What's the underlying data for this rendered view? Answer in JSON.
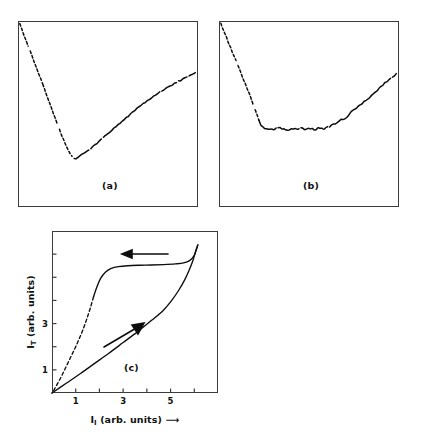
{
  "figure": {
    "panels": [
      {
        "id": "a",
        "caption": "(a)"
      },
      {
        "id": "b",
        "caption": "(b)"
      },
      {
        "id": "c",
        "caption": "(c)"
      }
    ]
  },
  "axes": {
    "x_title_symbol": "I",
    "x_title_subscript": "I",
    "x_title_units": "(arb. units)",
    "x_title_arrow": "⟶",
    "y_title_symbol": "I",
    "y_title_subscript": "T",
    "y_title_units": "(arb. units)",
    "x_ticks": [
      {
        "value": 1,
        "label": "1"
      },
      {
        "value": 2,
        "label": ""
      },
      {
        "value": 3,
        "label": "3"
      },
      {
        "value": 4,
        "label": ""
      },
      {
        "value": 5,
        "label": "5"
      },
      {
        "value": 6,
        "label": ""
      }
    ],
    "y_ticks": [
      {
        "value": 1,
        "label": "1"
      },
      {
        "value": 2,
        "label": ""
      },
      {
        "value": 3,
        "label": "3"
      },
      {
        "value": 4,
        "label": ""
      },
      {
        "value": 5,
        "label": ""
      },
      {
        "value": 6,
        "label": ""
      }
    ]
  },
  "annotations": {
    "upper_arrow_direction": "left",
    "lower_arrow_direction": "up-right"
  },
  "colors": {
    "curve": "#0d0d0d",
    "frame": "#3c3c3c",
    "background": "#ffffff"
  },
  "chart_data": [
    {
      "type": "line",
      "panel": "a",
      "title": "(a)",
      "xlabel": "",
      "ylabel": "",
      "xlim": [
        0,
        1
      ],
      "ylim": [
        0,
        1
      ],
      "grid": false,
      "legend": "none",
      "notes": "Normalised panel coordinates: x 0 = left frame, 1 = right frame; y 0 = bottom frame, 1 = top frame. Trace enters at top-left, falls steeply (dashed/noisy) to a minimum near x=0.31, then rises monotonically with small noise to the right edge.",
      "series": [
        {
          "name": "transmitted-intensity-trace-a",
          "style": "noisy-broken",
          "x": [
            0.01,
            0.03,
            0.055,
            0.08,
            0.105,
            0.13,
            0.155,
            0.18,
            0.205,
            0.23,
            0.255,
            0.28,
            0.3,
            0.315,
            0.33,
            0.35,
            0.37,
            0.395,
            0.42,
            0.45,
            0.48,
            0.51,
            0.54,
            0.57,
            0.6,
            0.63,
            0.66,
            0.69,
            0.72,
            0.75,
            0.78,
            0.81,
            0.84,
            0.87,
            0.9,
            0.93,
            0.96,
            0.985
          ],
          "y": [
            0.985,
            0.93,
            0.868,
            0.806,
            0.742,
            0.678,
            0.614,
            0.548,
            0.482,
            0.418,
            0.356,
            0.302,
            0.272,
            0.258,
            0.266,
            0.278,
            0.292,
            0.308,
            0.328,
            0.352,
            0.378,
            0.402,
            0.428,
            0.452,
            0.478,
            0.505,
            0.528,
            0.552,
            0.572,
            0.592,
            0.612,
            0.63,
            0.648,
            0.664,
            0.68,
            0.694,
            0.708,
            0.722
          ]
        }
      ]
    },
    {
      "type": "line",
      "panel": "b",
      "title": "(b)",
      "xlabel": "",
      "ylabel": "",
      "xlim": [
        0,
        1
      ],
      "ylim": [
        0,
        1
      ],
      "grid": false,
      "legend": "none",
      "notes": "Normalised panel coordinates. Trace enters at top-left, drops steeply (dashed) to a long flat noisy plateau from x=0.22 to x=0.60, then rises to the right edge.",
      "series": [
        {
          "name": "transmitted-intensity-trace-b",
          "style": "noisy-broken",
          "x": [
            0.01,
            0.035,
            0.06,
            0.085,
            0.11,
            0.135,
            0.16,
            0.185,
            0.21,
            0.23,
            0.255,
            0.28,
            0.305,
            0.33,
            0.355,
            0.38,
            0.405,
            0.43,
            0.455,
            0.48,
            0.505,
            0.53,
            0.555,
            0.58,
            0.605,
            0.63,
            0.655,
            0.68,
            0.705,
            0.73,
            0.76,
            0.79,
            0.82,
            0.85,
            0.88,
            0.91,
            0.945,
            0.985
          ],
          "y": [
            0.985,
            0.925,
            0.866,
            0.808,
            0.748,
            0.688,
            0.628,
            0.566,
            0.5,
            0.446,
            0.418,
            0.422,
            0.414,
            0.428,
            0.42,
            0.414,
            0.424,
            0.418,
            0.426,
            0.418,
            0.424,
            0.416,
            0.424,
            0.418,
            0.43,
            0.44,
            0.452,
            0.47,
            0.478,
            0.508,
            0.528,
            0.552,
            0.578,
            0.602,
            0.63,
            0.656,
            0.686,
            0.714
          ]
        }
      ]
    },
    {
      "type": "line",
      "panel": "c",
      "title": "(c)",
      "xlabel": "I_I (arb. units)",
      "ylabel": "I_T (arb. units)",
      "xlim": [
        0,
        7
      ],
      "ylim": [
        0,
        7
      ],
      "grid": false,
      "legend": "none",
      "notes": "Bistable hysteresis loop. Lower (increasing-input) branch is a straight solid line from the origin that turns up sharply near x=5.2 and switches at x~6.0. Upper (decreasing-input) branch comes back from the switch point along a high plateau and drops steeply near x=1.6-2.0, joining the origin through a dashed segment.",
      "series": [
        {
          "name": "increasing-branch",
          "style": "solid",
          "direction": "up-right",
          "x": [
            0.0,
            0.6,
            1.2,
            1.8,
            2.4,
            3.0,
            3.6,
            4.2,
            4.7,
            5.05,
            5.35,
            5.6,
            5.8,
            5.95,
            6.05,
            6.15
          ],
          "y": [
            0.0,
            0.42,
            0.84,
            1.28,
            1.72,
            2.18,
            2.64,
            3.14,
            3.58,
            4.0,
            4.45,
            4.9,
            5.35,
            5.75,
            6.1,
            6.4
          ]
        },
        {
          "name": "decreasing-branch",
          "style": "solid-with-dashed-tail",
          "direction": "left",
          "x": [
            6.15,
            6.0,
            5.8,
            5.55,
            5.2,
            4.7,
            4.2,
            3.7,
            3.2,
            2.8,
            2.5,
            2.25,
            2.05,
            1.9,
            1.75,
            1.6,
            1.45,
            1.3,
            1.15,
            1.0,
            0.85,
            0.7,
            0.55,
            0.4,
            0.25,
            0.1,
            0.0
          ],
          "y": [
            6.4,
            5.95,
            5.72,
            5.62,
            5.58,
            5.55,
            5.53,
            5.52,
            5.5,
            5.46,
            5.38,
            5.22,
            4.95,
            4.6,
            4.15,
            3.62,
            3.15,
            2.72,
            2.35,
            2.0,
            1.68,
            1.36,
            1.04,
            0.72,
            0.44,
            0.16,
            0.0
          ],
          "dashed_from_x": 1.75
        }
      ]
    }
  ]
}
